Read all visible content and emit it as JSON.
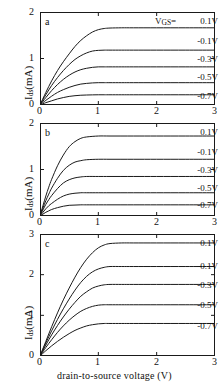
{
  "figure": {
    "xlabel": "drain-to-source voltage (V)",
    "ylabel_main": "I",
    "ylabel_sub": "ds",
    "ylabel_unit": "(mA)",
    "vgs_header": "V",
    "vgs_header_sub": "GS",
    "vgs_header_eq": "=",
    "panels": [
      {
        "letter": "a"
      },
      {
        "letter": "b"
      },
      {
        "letter": "c"
      }
    ]
  },
  "chart_data": [
    {
      "type": "line",
      "panel": "a",
      "title": "",
      "xlabel": "drain-to-source voltage (V)",
      "ylabel": "I_ds (mA)",
      "xlim": [
        0,
        3
      ],
      "ylim": [
        0,
        2
      ],
      "xticks": [
        "0",
        "1",
        "2",
        "3"
      ],
      "xtick_values": [
        0,
        1,
        2,
        3
      ],
      "yticks": [
        "0",
        "1",
        "2"
      ],
      "ytick_values": [
        0,
        1,
        2
      ],
      "grid": false,
      "legend_position": "right-inside",
      "series": [
        {
          "name": "0.1V",
          "saturation": 1.65,
          "knee": 0.95,
          "x": [
            0,
            0.1,
            0.2,
            0.3,
            0.4,
            0.5,
            0.6,
            0.7,
            0.8,
            0.9,
            1.0,
            1.1,
            1.2,
            1.4,
            1.6,
            2.0,
            2.5,
            3.0
          ],
          "y": [
            0,
            0.27,
            0.52,
            0.74,
            0.93,
            1.1,
            1.26,
            1.39,
            1.49,
            1.57,
            1.62,
            1.645,
            1.655,
            1.66,
            1.66,
            1.66,
            1.66,
            1.66
          ]
        },
        {
          "name": "-0.1V",
          "saturation": 1.18,
          "knee": 0.82,
          "x": [
            0,
            0.1,
            0.2,
            0.3,
            0.4,
            0.5,
            0.6,
            0.7,
            0.8,
            0.9,
            1.0,
            1.1,
            1.2,
            1.4,
            1.6,
            2.0,
            2.5,
            3.0
          ],
          "y": [
            0,
            0.22,
            0.42,
            0.59,
            0.74,
            0.87,
            0.98,
            1.06,
            1.12,
            1.16,
            1.175,
            1.18,
            1.18,
            1.18,
            1.18,
            1.18,
            1.18,
            1.18
          ]
        },
        {
          "name": "-0.3V",
          "saturation": 0.82,
          "knee": 0.72,
          "x": [
            0,
            0.1,
            0.2,
            0.3,
            0.4,
            0.5,
            0.6,
            0.7,
            0.8,
            0.9,
            1.0,
            1.1,
            1.2,
            1.4,
            1.6,
            2.0,
            2.5,
            3.0
          ],
          "y": [
            0,
            0.16,
            0.31,
            0.44,
            0.55,
            0.64,
            0.71,
            0.76,
            0.79,
            0.81,
            0.82,
            0.82,
            0.82,
            0.82,
            0.82,
            0.82,
            0.82,
            0.82
          ]
        },
        {
          "name": "-0.5V",
          "saturation": 0.48,
          "knee": 0.62,
          "x": [
            0,
            0.1,
            0.2,
            0.3,
            0.4,
            0.5,
            0.6,
            0.7,
            0.8,
            0.9,
            1.0,
            1.1,
            1.2,
            1.4,
            1.6,
            2.0,
            2.5,
            3.0
          ],
          "y": [
            0,
            0.1,
            0.19,
            0.27,
            0.33,
            0.38,
            0.42,
            0.45,
            0.465,
            0.475,
            0.48,
            0.48,
            0.48,
            0.48,
            0.48,
            0.48,
            0.48,
            0.48
          ]
        },
        {
          "name": "-0.7V",
          "saturation": 0.22,
          "knee": 0.55,
          "x": [
            0,
            0.1,
            0.2,
            0.3,
            0.4,
            0.5,
            0.6,
            0.7,
            0.8,
            0.9,
            1.0,
            1.1,
            1.2,
            1.4,
            1.6,
            2.0,
            2.5,
            3.0
          ],
          "y": [
            0,
            0.05,
            0.09,
            0.13,
            0.16,
            0.185,
            0.2,
            0.21,
            0.215,
            0.218,
            0.22,
            0.22,
            0.22,
            0.22,
            0.22,
            0.22,
            0.22,
            0.22
          ]
        }
      ]
    },
    {
      "type": "line",
      "panel": "b",
      "title": "",
      "xlabel": "drain-to-source voltage (V)",
      "ylabel": "I_ds (mA)",
      "xlim": [
        0,
        3
      ],
      "ylim": [
        0,
        2
      ],
      "xticks": [
        "0",
        "1",
        "2",
        "3"
      ],
      "xtick_values": [
        0,
        1,
        2,
        3
      ],
      "yticks": [
        "0",
        "1",
        "2"
      ],
      "ytick_values": [
        0,
        1,
        2
      ],
      "grid": false,
      "legend_position": "right-inside",
      "series": [
        {
          "name": "0.1V",
          "saturation": 1.72,
          "knee": 0.62,
          "x": [
            0,
            0.05,
            0.1,
            0.15,
            0.2,
            0.3,
            0.4,
            0.5,
            0.6,
            0.7,
            0.8,
            1.0,
            1.2,
            1.6,
            2.0,
            2.5,
            3.0
          ],
          "y": [
            0,
            0.22,
            0.43,
            0.62,
            0.79,
            1.08,
            1.31,
            1.49,
            1.6,
            1.67,
            1.7,
            1.72,
            1.72,
            1.72,
            1.72,
            1.72,
            1.72
          ]
        },
        {
          "name": "-0.1V",
          "saturation": 1.22,
          "knee": 0.55,
          "x": [
            0,
            0.05,
            0.1,
            0.15,
            0.2,
            0.3,
            0.4,
            0.5,
            0.6,
            0.7,
            0.8,
            1.0,
            1.2,
            1.6,
            2.0,
            2.5,
            3.0
          ],
          "y": [
            0,
            0.17,
            0.33,
            0.47,
            0.6,
            0.81,
            0.98,
            1.09,
            1.16,
            1.19,
            1.21,
            1.22,
            1.22,
            1.22,
            1.22,
            1.22,
            1.22
          ]
        },
        {
          "name": "-0.3V",
          "saturation": 0.85,
          "knee": 0.5,
          "x": [
            0,
            0.05,
            0.1,
            0.15,
            0.2,
            0.3,
            0.4,
            0.5,
            0.6,
            0.7,
            0.8,
            1.0,
            1.2,
            1.6,
            2.0,
            2.5,
            3.0
          ],
          "y": [
            0,
            0.13,
            0.25,
            0.35,
            0.44,
            0.59,
            0.71,
            0.78,
            0.82,
            0.84,
            0.85,
            0.85,
            0.85,
            0.85,
            0.85,
            0.85,
            0.85
          ]
        },
        {
          "name": "-0.5V",
          "saturation": 0.5,
          "knee": 0.45,
          "x": [
            0,
            0.05,
            0.1,
            0.15,
            0.2,
            0.3,
            0.4,
            0.5,
            0.6,
            0.7,
            0.8,
            1.0,
            1.2,
            1.6,
            2.0,
            2.5,
            3.0
          ],
          "y": [
            0,
            0.08,
            0.155,
            0.22,
            0.27,
            0.36,
            0.43,
            0.47,
            0.49,
            0.5,
            0.5,
            0.5,
            0.5,
            0.5,
            0.5,
            0.5,
            0.5
          ]
        },
        {
          "name": "-0.7V",
          "saturation": 0.24,
          "knee": 0.42,
          "x": [
            0,
            0.05,
            0.1,
            0.15,
            0.2,
            0.3,
            0.4,
            0.5,
            0.6,
            0.7,
            0.8,
            1.0,
            1.2,
            1.6,
            2.0,
            2.5,
            3.0
          ],
          "y": [
            0,
            0.04,
            0.08,
            0.11,
            0.14,
            0.18,
            0.21,
            0.23,
            0.235,
            0.24,
            0.24,
            0.24,
            0.24,
            0.24,
            0.24,
            0.24,
            0.24
          ]
        }
      ]
    },
    {
      "type": "line",
      "panel": "c",
      "title": "",
      "xlabel": "drain-to-source voltage (V)",
      "ylabel": "I_ds (mA)",
      "xlim": [
        0,
        3
      ],
      "ylim": [
        0,
        3
      ],
      "xticks": [
        "0",
        "1",
        "2",
        "3"
      ],
      "xtick_values": [
        0,
        1,
        2,
        3
      ],
      "yticks": [
        "0",
        "1",
        "2",
        "3"
      ],
      "ytick_values": [
        0,
        1,
        2,
        3
      ],
      "grid": false,
      "legend_position": "right-inside",
      "series": [
        {
          "name": "0.1V",
          "saturation": 2.78,
          "knee": 1.1,
          "x": [
            0,
            0.1,
            0.2,
            0.3,
            0.4,
            0.5,
            0.6,
            0.7,
            0.8,
            0.9,
            1.0,
            1.1,
            1.2,
            1.4,
            1.6,
            2.0,
            2.5,
            3.0
          ],
          "y": [
            0,
            0.36,
            0.72,
            1.06,
            1.38,
            1.67,
            1.94,
            2.18,
            2.38,
            2.54,
            2.66,
            2.73,
            2.765,
            2.78,
            2.78,
            2.78,
            2.78,
            2.78
          ]
        },
        {
          "name": "-0.1V",
          "saturation": 2.2,
          "knee": 0.95,
          "x": [
            0,
            0.1,
            0.2,
            0.3,
            0.4,
            0.5,
            0.6,
            0.7,
            0.8,
            0.9,
            1.0,
            1.1,
            1.2,
            1.4,
            1.6,
            2.0,
            2.5,
            3.0
          ],
          "y": [
            0,
            0.32,
            0.62,
            0.9,
            1.16,
            1.4,
            1.62,
            1.81,
            1.96,
            2.07,
            2.14,
            2.18,
            2.2,
            2.2,
            2.2,
            2.2,
            2.2,
            2.2
          ]
        },
        {
          "name": "-0.3V",
          "saturation": 1.76,
          "knee": 0.88,
          "x": [
            0,
            0.1,
            0.2,
            0.3,
            0.4,
            0.5,
            0.6,
            0.7,
            0.8,
            0.9,
            1.0,
            1.1,
            1.2,
            1.4,
            1.6,
            2.0,
            2.5,
            3.0
          ],
          "y": [
            0,
            0.27,
            0.52,
            0.75,
            0.96,
            1.15,
            1.32,
            1.47,
            1.58,
            1.67,
            1.72,
            1.75,
            1.76,
            1.76,
            1.76,
            1.76,
            1.76,
            1.76
          ]
        },
        {
          "name": "-0.5V",
          "saturation": 1.26,
          "knee": 0.8,
          "x": [
            0,
            0.1,
            0.2,
            0.3,
            0.4,
            0.5,
            0.6,
            0.7,
            0.8,
            0.9,
            1.0,
            1.1,
            1.2,
            1.4,
            1.6,
            2.0,
            2.5,
            3.0
          ],
          "y": [
            0,
            0.21,
            0.4,
            0.58,
            0.74,
            0.88,
            1.0,
            1.1,
            1.17,
            1.22,
            1.25,
            1.26,
            1.26,
            1.26,
            1.26,
            1.26,
            1.26,
            1.26
          ]
        },
        {
          "name": "-0.7V",
          "saturation": 0.8,
          "knee": 0.85,
          "x": [
            0,
            0.1,
            0.2,
            0.3,
            0.4,
            0.5,
            0.6,
            0.7,
            0.8,
            0.9,
            1.0,
            1.1,
            1.2,
            1.4,
            1.6,
            2.0,
            2.5,
            3.0
          ],
          "y": [
            0,
            0.13,
            0.25,
            0.36,
            0.46,
            0.55,
            0.63,
            0.69,
            0.74,
            0.77,
            0.79,
            0.8,
            0.8,
            0.8,
            0.8,
            0.8,
            0.8,
            0.8
          ]
        }
      ]
    }
  ]
}
